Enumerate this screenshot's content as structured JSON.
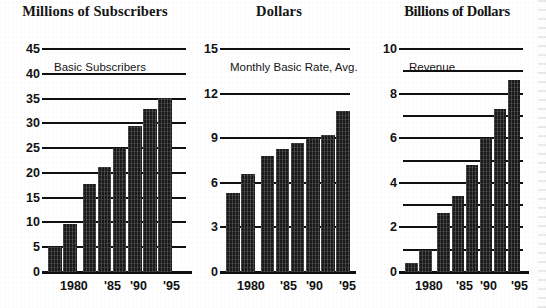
{
  "chart_data": [
    {
      "type": "bar",
      "title": "Millions of Subscribers",
      "series_label": "Basic Subscribers",
      "xlabel": "",
      "ylabel": "Millions of Subscribers",
      "ylim": [
        0,
        45
      ],
      "yticks": [
        0,
        5,
        10,
        15,
        20,
        25,
        30,
        35,
        40,
        45
      ],
      "ytick_labels": [
        "0",
        "5",
        "10",
        "15",
        "20",
        "25",
        "30",
        "35",
        "40",
        "45"
      ],
      "grid": true,
      "legend": "none",
      "categories": [
        "1980",
        "1985",
        "1990",
        "1991",
        "1992",
        "1993",
        "1994",
        "1995"
      ],
      "xtick_labels": [
        "1980",
        "'85",
        "'90",
        "'95"
      ],
      "values": [
        5.0,
        9.7,
        17.7,
        21.2,
        25.0,
        29.5,
        32.8,
        35.2
      ]
    },
    {
      "type": "bar",
      "title": "Dollars",
      "series_label": "Monthly Basic Rate, Avg.",
      "xlabel": "",
      "ylabel": "Dollars",
      "ylim": [
        0,
        15
      ],
      "yticks": [
        0,
        3,
        6,
        9,
        12,
        15
      ],
      "ytick_labels": [
        "0",
        "3",
        "6",
        "9",
        "12",
        "15"
      ],
      "grid": true,
      "legend": "none",
      "categories": [
        "1980",
        "1985",
        "1990",
        "1991",
        "1992",
        "1993",
        "1994",
        "1995"
      ],
      "xtick_labels": [
        "1980",
        "'85",
        "'90",
        "'95"
      ],
      "values": [
        5.3,
        6.6,
        7.8,
        8.3,
        8.7,
        9.0,
        9.2,
        10.8
      ]
    },
    {
      "type": "bar",
      "title": "Billions of Dollars",
      "series_label": "Revenue",
      "xlabel": "",
      "ylabel": "Billions of Dollars",
      "ylim": [
        0,
        10
      ],
      "yticks": [
        0,
        1,
        2,
        3,
        4,
        5,
        6,
        7,
        8,
        9,
        10
      ],
      "ytick_labels": [
        "0",
        "2",
        "4",
        "6",
        "8",
        "10"
      ],
      "grid": true,
      "legend": "none",
      "categories": [
        "1980",
        "1985",
        "1990",
        "1991",
        "1992",
        "1993",
        "1994",
        "1995"
      ],
      "xtick_labels": [
        "1980",
        "'85",
        "'90",
        "'95"
      ],
      "values": [
        0.4,
        1.0,
        2.65,
        3.4,
        4.8,
        6.0,
        7.3,
        8.6
      ]
    }
  ],
  "panels": [
    {
      "title": "Millions of Subscribers",
      "series_label": "Basic Subscribers",
      "y_labels": [
        "45",
        "40",
        "35",
        "30",
        "25",
        "20",
        "15",
        "10",
        "5",
        "0"
      ],
      "x_labels": [
        "1980",
        "'85",
        "'90",
        "'95"
      ]
    },
    {
      "title": "Dollars",
      "series_label": "Monthly Basic Rate, Avg.",
      "y_labels": [
        "15",
        "12",
        "9",
        "6",
        "3",
        "0"
      ],
      "x_labels": [
        "1980",
        "'85",
        "'90",
        "'95"
      ]
    },
    {
      "title": "Billions of Dollars",
      "series_label": "Revenue",
      "y_labels": [
        "10",
        "8",
        "6",
        "4",
        "2",
        "0"
      ],
      "x_labels": [
        "1980",
        "'85",
        "'90",
        "'95"
      ]
    }
  ],
  "colors": {
    "bar": "#1a1a1a",
    "axis": "#111111",
    "background": "#ffffff"
  }
}
